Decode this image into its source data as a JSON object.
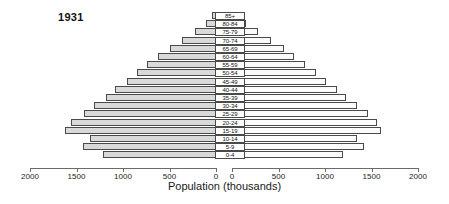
{
  "chart_data": {
    "type": "bar",
    "title": "1931",
    "xlabel": "Population (thousands)",
    "ylabel": "",
    "orientation": "population-pyramid",
    "categories": [
      "0-4",
      "5-9",
      "10-14",
      "15-19",
      "20-24",
      "25-29",
      "30-34",
      "35-39",
      "40-44",
      "45-49",
      "50-54",
      "55-59",
      "60-64",
      "65-69",
      "70-74",
      "75-79",
      "80-84",
      "85+"
    ],
    "series": [
      {
        "name": "Male",
        "side": "left",
        "values": [
          1210,
          1430,
          1360,
          1620,
          1560,
          1420,
          1310,
          1180,
          1090,
          960,
          850,
          740,
          620,
          500,
          370,
          230,
          110,
          40
        ]
      },
      {
        "name": "Female",
        "side": "right",
        "values": [
          1190,
          1420,
          1340,
          1600,
          1560,
          1460,
          1340,
          1230,
          1130,
          1010,
          900,
          790,
          670,
          560,
          420,
          280,
          150,
          55
        ]
      }
    ],
    "xlim_left": [
      2000,
      0
    ],
    "xlim_right": [
      0,
      2000
    ],
    "xticks_left": [
      "2000",
      "1500",
      "1000",
      "500",
      "0"
    ],
    "xticks_right": [
      "0",
      "500",
      "1000",
      "1500",
      "2000"
    ],
    "xtick_values": [
      2000,
      1500,
      1000,
      500,
      0
    ],
    "grid": false,
    "legend": "none",
    "colors": {
      "male_fill": "#d9d9d9",
      "female_fill": "#fbfbfb",
      "bar_border": "#4a4a4a",
      "axis": "#6b6b6b",
      "text": "#1a1a1a"
    }
  }
}
